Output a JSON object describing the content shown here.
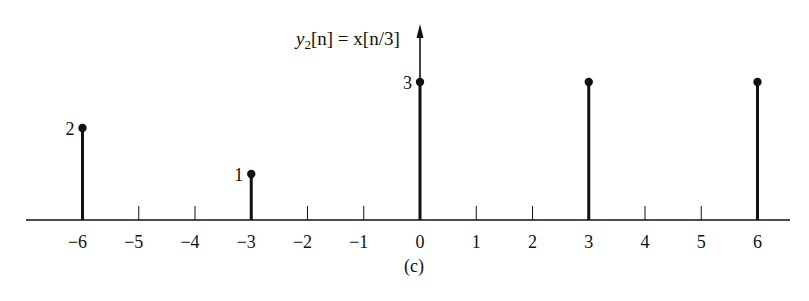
{
  "chart_data": {
    "type": "stem",
    "title": "y2[n] = x[n/3]",
    "title_parts": {
      "y": "y",
      "sub": "2",
      "rest": "[n] = x[n/3]"
    },
    "caption": "(c)",
    "xlabel": "n",
    "ylabel": "y2[n]",
    "x_ticks": [
      -6,
      -5,
      -4,
      -3,
      -2,
      -1,
      0,
      1,
      2,
      3,
      4,
      5,
      6
    ],
    "x_tick_labels": [
      "−6",
      "−5",
      "−4",
      "−3",
      "−2",
      "−1",
      "0",
      "1",
      "2",
      "3",
      "4",
      "5",
      "6"
    ],
    "points": [
      {
        "n": -6,
        "value": 2,
        "label": "2"
      },
      {
        "n": -3,
        "value": 1,
        "label": "1"
      },
      {
        "n": 0,
        "value": 3,
        "label": "3"
      },
      {
        "n": 3,
        "value": 3,
        "label": ""
      },
      {
        "n": 6,
        "value": 3,
        "label": ""
      }
    ],
    "xlim": [
      -7,
      7
    ],
    "ylim": [
      0,
      3.5
    ],
    "grid": false,
    "legend": null,
    "colors": {
      "stem": "#111111",
      "axis": "#111111"
    }
  }
}
